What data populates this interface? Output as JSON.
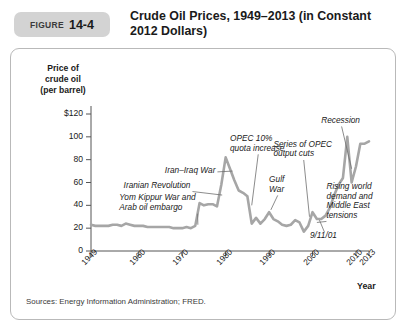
{
  "figure": {
    "badge_word": "FIGURE",
    "badge_number": "14-4",
    "title": "Crude Oil Prices, 1949–2013 (in Constant 2012 Dollars)",
    "sources": "Sources: Energy Information Administration; FRED."
  },
  "colors": {
    "line": "#a6a6a6",
    "axis": "#555555",
    "badge_bg": "#d3d3d3",
    "panel_border": "#b9b9b9",
    "text": "#1a1a1a"
  },
  "chart_data": {
    "type": "line",
    "title": "Crude Oil Prices, 1949–2013 (in Constant 2012 Dollars)",
    "xlabel": "Year",
    "ylabel": "Price of crude oil (per barrel)",
    "ylabel_lines": [
      "Price of",
      "crude oil",
      "(per barrel)"
    ],
    "xlim": [
      1949,
      2013
    ],
    "ylim": [
      0,
      120
    ],
    "yticks": [
      0,
      20,
      40,
      60,
      80,
      100,
      120
    ],
    "ytick_labels": [
      "0",
      "20",
      "40",
      "60",
      "80",
      "100",
      "$120"
    ],
    "xticks": [
      1949,
      1960,
      1970,
      1980,
      1990,
      2000,
      2010,
      2013
    ],
    "xtick_labels": [
      "1949",
      "1960",
      "1970",
      "1980",
      "1990",
      "2000",
      "2010",
      "2013"
    ],
    "grid": false,
    "legend": "none",
    "series": [
      {
        "name": "Real crude oil price (2012 dollars per barrel)",
        "x": [
          1949,
          1950,
          1951,
          1952,
          1953,
          1954,
          1955,
          1956,
          1957,
          1958,
          1959,
          1960,
          1961,
          1962,
          1963,
          1964,
          1965,
          1966,
          1967,
          1968,
          1969,
          1970,
          1971,
          1972,
          1973,
          1974,
          1975,
          1976,
          1977,
          1978,
          1979,
          1980,
          1981,
          1982,
          1983,
          1984,
          1985,
          1986,
          1987,
          1988,
          1989,
          1990,
          1991,
          1992,
          1993,
          1994,
          1995,
          1996,
          1997,
          1998,
          1999,
          2000,
          2001,
          2002,
          2003,
          2004,
          2005,
          2006,
          2007,
          2008,
          2009,
          2010,
          2011,
          2012,
          2013
        ],
        "values": [
          23,
          22,
          22,
          22,
          22,
          23,
          23,
          22,
          24,
          23,
          22,
          22,
          22,
          21,
          21,
          21,
          21,
          21,
          21,
          20,
          20,
          20,
          21,
          20,
          22,
          42,
          40,
          41,
          41,
          39,
          58,
          82,
          72,
          62,
          53,
          51,
          48,
          24,
          29,
          24,
          28,
          34,
          28,
          26,
          23,
          22,
          23,
          27,
          25,
          17,
          22,
          34,
          28,
          28,
          31,
          38,
          49,
          58,
          64,
          100,
          60,
          74,
          94,
          94,
          96
        ],
        "style": "solid",
        "color": "#a6a6a6",
        "width": 2.6
      }
    ],
    "annotations": [
      {
        "id": "yom-kippur",
        "text": "Yom Kippur War and\nArab oil embargo",
        "x": 1955.5,
        "y": 46,
        "point_x": 1973.6,
        "point_y": 23
      },
      {
        "id": "iranian-revolution",
        "text": "Iranian Revolution",
        "x": 1956.5,
        "y": 57,
        "point_x": 1979.2,
        "point_y": 49
      },
      {
        "id": "iran-iraq-war",
        "text": "Iran–Iraq War",
        "x": 1966.0,
        "y": 70,
        "point_x": 1981.6,
        "point_y": 70
      },
      {
        "id": "opec-quota",
        "text": "OPEC 10%\nquota increase",
        "x": 1981.0,
        "y": 98,
        "point_x": 1986.0,
        "point_y": 40
      },
      {
        "id": "gulf-war",
        "text": "Gulf\nWar",
        "x": 1990.0,
        "y": 62,
        "point_x": 1990.4,
        "point_y": 36
      },
      {
        "id": "opec-output-cuts",
        "text": "Series of OPEC\noutput cuts",
        "x": 1991.0,
        "y": 93,
        "point_x": 1999.3,
        "point_y": 30
      },
      {
        "id": "recession",
        "text": "Recession",
        "x": 2002.0,
        "y": 114,
        "point_x": 2009.0,
        "point_y": 72
      },
      {
        "id": "september-11",
        "text": "9/11/01",
        "x": 1999.4,
        "y": 13,
        "point_x": 2001.6,
        "point_y": 27
      },
      {
        "id": "rising-demand",
        "text": "Rising world\ndemand and\nMiddle East\ntensions",
        "x": 2003.2,
        "y": 56,
        "point_x": 2001.0,
        "point_y": 25
      }
    ]
  }
}
